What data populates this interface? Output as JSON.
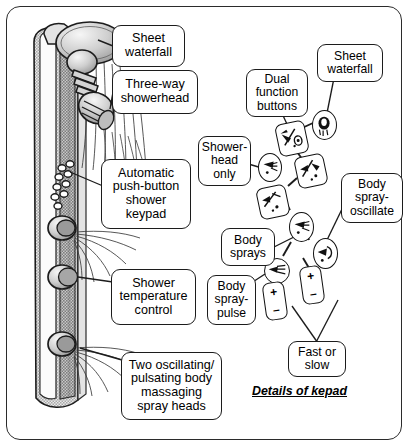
{
  "figure": {
    "caption": "Details of kepad"
  },
  "left_panel": {
    "callouts": [
      {
        "id": "sheet-waterfall",
        "text": "Sheet\nwaterfall"
      },
      {
        "id": "three-way-showerhead",
        "text": "Three-way\nshowerhead"
      },
      {
        "id": "automatic-keypad",
        "text": "Automatic\npush-button\nshower\nkeypad"
      },
      {
        "id": "shower-temperature-control",
        "text": "Shower\ntemperature\ncontrol"
      },
      {
        "id": "body-massaging-spray-heads",
        "text": "Two oscillating/\npulsating body\nmassaging\nspray heads"
      }
    ],
    "parts": {
      "column": "shower-column",
      "head": "three-way-showerhead",
      "waterfall": "sheet-waterfall-spray",
      "keypad": "push-button-keypad",
      "temp_knob": "temperature-control-knob",
      "spray_head_upper": "oscillating-spray-head-upper",
      "spray_head_lower": "oscillating-spray-head-lower"
    }
  },
  "right_panel": {
    "callouts": [
      {
        "id": "sheet-waterfall",
        "text": "Sheet\nwaterfall"
      },
      {
        "id": "dual-function-buttons",
        "text": "Dual\nfunction\nbuttons"
      },
      {
        "id": "showerhead-only",
        "text": "Shower-\nhead\nonly"
      },
      {
        "id": "body-spray-oscillate",
        "text": "Body\nspray-\noscillate"
      },
      {
        "id": "body-sprays",
        "text": "Body\nsprays"
      },
      {
        "id": "body-spray-pulse",
        "text": "Body\nspray-\npulse"
      },
      {
        "id": "fast-or-slow",
        "text": "Fast or\nslow"
      }
    ],
    "buttons": [
      {
        "id": "sheet-waterfall-button",
        "icon": "waterfall-icon",
        "shape": "oval",
        "label": "Sheet waterfall"
      },
      {
        "id": "dual-function-button-a",
        "icon": "dual-function-icon",
        "shape": "rrect",
        "label": "Dual function"
      },
      {
        "id": "dual-function-button-b",
        "icon": "dual-function-icon-2",
        "shape": "rrect",
        "label": "Dual function"
      },
      {
        "id": "showerhead-only-button",
        "icon": "showerhead-icon",
        "shape": "oval",
        "label": "Showerhead only"
      },
      {
        "id": "spray-cross-button",
        "icon": "spray-cross-icon",
        "shape": "rrect",
        "label": "Spray"
      },
      {
        "id": "body-sprays-button",
        "icon": "body-spray-icon",
        "shape": "oval",
        "label": "Body sprays"
      },
      {
        "id": "body-spray-oscillate-button",
        "icon": "oscillate-icon",
        "shape": "oval",
        "label": "Body spray oscillate"
      },
      {
        "id": "body-spray-pulse-button",
        "icon": "pulse-icon",
        "shape": "oval",
        "label": "Body spray pulse"
      },
      {
        "id": "rocker-left-button",
        "icon": "plus-minus-icon",
        "shape": "rrect",
        "label": "Fast or slow"
      },
      {
        "id": "rocker-right-button",
        "icon": "plus-minus-icon",
        "shape": "rrect",
        "label": "Fast or slow"
      }
    ],
    "rocker_symbols": {
      "plus": "+",
      "minus": "–"
    }
  },
  "colors": {
    "ink": "#1c1c1c",
    "paper": "#ffffff",
    "shade_light": "#d8d8d8",
    "shade_mid": "#b4b4b4",
    "shade_dark": "#8e8e8e"
  }
}
